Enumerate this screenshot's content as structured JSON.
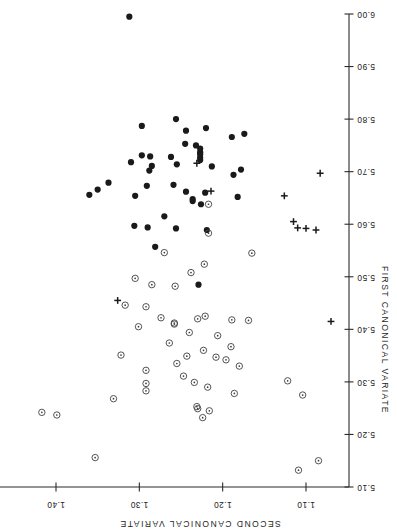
{
  "figure": {
    "title": "",
    "background_color": "#ffffff",
    "orientation_note": "rotated-180"
  },
  "chart_data": {
    "type": "scatter",
    "title": "",
    "xlabel": "FIRST CANONICAL VARIATE",
    "ylabel": "SECOND CANONICAL VARIATE",
    "xlim": [
      5.1,
      6.0
    ],
    "ylim": [
      1.05,
      1.44
    ],
    "xticks": [
      5.1,
      5.2,
      5.3,
      5.4,
      5.5,
      5.6,
      5.7,
      5.8,
      5.9,
      6.0
    ],
    "xticklabels": [
      "5.10",
      "5.20",
      "5.30",
      "5.40",
      "5.50",
      "5.60",
      "5.70",
      "5.80",
      "5.90",
      "6.00"
    ],
    "yticks": [
      1.1,
      1.2,
      1.3,
      1.4
    ],
    "yticklabels": [
      "1.10",
      "1.20",
      "1.30",
      "1.40"
    ],
    "grid": false,
    "legend": null,
    "series": [
      {
        "name": "filled-circle-group",
        "marker": "filled-circle",
        "color": "#1a1a1a",
        "points": [
          [
            5.995,
            1.312
          ],
          [
            5.8,
            1.256
          ],
          [
            5.787,
            1.297
          ],
          [
            5.783,
            1.22
          ],
          [
            5.778,
            1.244
          ],
          [
            5.772,
            1.174
          ],
          [
            5.766,
            1.189
          ],
          [
            5.753,
            1.245
          ],
          [
            5.75,
            1.232
          ],
          [
            5.744,
            1.227
          ],
          [
            5.737,
            1.227
          ],
          [
            5.733,
            1.227
          ],
          [
            5.731,
            1.297
          ],
          [
            5.729,
            1.287
          ],
          [
            5.728,
            1.262
          ],
          [
            5.727,
            1.227
          ],
          [
            5.722,
            1.227
          ],
          [
            5.718,
            1.31
          ],
          [
            5.714,
            1.255
          ],
          [
            5.711,
            1.285
          ],
          [
            5.71,
            1.213
          ],
          [
            5.704,
            1.178
          ],
          [
            5.702,
            1.288
          ],
          [
            5.694,
            1.187
          ],
          [
            5.679,
            1.337
          ],
          [
            5.675,
            1.259
          ],
          [
            5.673,
            1.291
          ],
          [
            5.666,
            1.35
          ],
          [
            5.662,
            1.244
          ],
          [
            5.66,
            1.221
          ],
          [
            5.656,
            1.36
          ],
          [
            5.654,
            1.305
          ],
          [
            5.652,
            1.182
          ],
          [
            5.648,
            1.236
          ],
          [
            5.644,
            1.236
          ],
          [
            5.638,
            1.226
          ],
          [
            5.615,
            1.27
          ],
          [
            5.597,
            1.306
          ],
          [
            5.594,
            1.29
          ],
          [
            5.592,
            1.256
          ],
          [
            5.589,
            1.219
          ],
          [
            5.557,
            1.281
          ],
          [
            5.485,
            1.229
          ]
        ]
      },
      {
        "name": "open-circle-group",
        "marker": "open-circle-dot",
        "color": "#4a4a4a",
        "points": [
          [
            5.638,
            1.217
          ],
          [
            5.583,
            1.217
          ],
          [
            5.546,
            1.27
          ],
          [
            5.545,
            1.165
          ],
          [
            5.524,
            1.222
          ],
          [
            5.508,
            1.238
          ],
          [
            5.497,
            1.305
          ],
          [
            5.485,
            1.285
          ],
          [
            5.482,
            1.257
          ],
          [
            5.446,
            1.317
          ],
          [
            5.443,
            1.292
          ],
          [
            5.425,
            1.221
          ],
          [
            5.422,
            1.274
          ],
          [
            5.42,
            1.23
          ],
          [
            5.418,
            1.189
          ],
          [
            5.417,
            1.169
          ],
          [
            5.412,
            1.258
          ],
          [
            5.41,
            1.258
          ],
          [
            5.405,
            1.301
          ],
          [
            5.394,
            1.24
          ],
          [
            5.388,
            1.206
          ],
          [
            5.374,
            1.264
          ],
          [
            5.367,
            1.19
          ],
          [
            5.36,
            1.223
          ],
          [
            5.351,
            1.322
          ],
          [
            5.349,
            1.243
          ],
          [
            5.347,
            1.208
          ],
          [
            5.342,
            1.196
          ],
          [
            5.335,
            1.255
          ],
          [
            5.33,
            1.18
          ],
          [
            5.322,
            1.292
          ],
          [
            5.311,
            1.247
          ],
          [
            5.302,
            1.122
          ],
          [
            5.299,
            1.234
          ],
          [
            5.297,
            1.292
          ],
          [
            5.29,
            1.218
          ],
          [
            5.283,
            1.292
          ],
          [
            5.278,
            1.186
          ],
          [
            5.275,
            1.104
          ],
          [
            5.268,
            1.331
          ],
          [
            5.253,
            1.231
          ],
          [
            5.249,
            1.23
          ],
          [
            5.245,
            1.216
          ],
          [
            5.242,
            1.417
          ],
          [
            5.237,
            1.399
          ],
          [
            5.232,
            1.224
          ],
          [
            5.156,
            1.353
          ],
          [
            5.15,
            1.085
          ],
          [
            5.132,
            1.109
          ]
        ]
      },
      {
        "name": "plus-group",
        "marker": "plus",
        "color": "#1a1a1a",
        "points": [
          [
            5.697,
            1.083
          ],
          [
            5.716,
            1.231
          ],
          [
            5.663,
            1.214
          ],
          [
            5.654,
            1.126
          ],
          [
            5.605,
            1.115
          ],
          [
            5.593,
            1.11
          ],
          [
            5.592,
            1.1
          ],
          [
            5.589,
            1.088
          ],
          [
            5.455,
            1.326
          ],
          [
            5.415,
            1.07
          ]
        ]
      }
    ]
  },
  "axes": {
    "x_axis": {
      "name": "first-canonical-variate-axis",
      "label": "FIRST CANONICAL VARIATE",
      "min": 5.1,
      "max": 6.0,
      "tick_values": [
        5.1,
        5.2,
        5.3,
        5.4,
        5.5,
        5.6,
        5.7,
        5.8,
        5.9,
        6.0
      ],
      "tick_labels": [
        "5.10",
        "5.20",
        "5.30",
        "5.40",
        "5.50",
        "5.60",
        "5.70",
        "5.80",
        "5.90",
        "6.00"
      ]
    },
    "y_axis": {
      "name": "second-canonical-variate-axis",
      "label": "SECOND CANONICAL VARIATE",
      "min": 1.05,
      "max": 1.44,
      "tick_values": [
        1.1,
        1.2,
        1.3,
        1.4
      ],
      "tick_labels": [
        "1.10",
        "1.20",
        "1.30",
        "1.40"
      ]
    }
  },
  "geometry": {
    "x_axis_pixel": {
      "at_min": 487,
      "at_max": 14,
      "line_x": 349
    },
    "y_axis_pixel": {
      "at_110": 306,
      "at_140": 56,
      "line_y": 487
    }
  }
}
